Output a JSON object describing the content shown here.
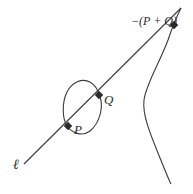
{
  "diagram": {
    "line_label": "ℓ",
    "points": [
      {
        "id": "P",
        "label": "P",
        "x": 68,
        "y": 126
      },
      {
        "id": "Q",
        "label": "Q",
        "x": 99,
        "y": 95
      },
      {
        "id": "neg_sum",
        "label": "−(P + Q)",
        "x": 174,
        "y": 25
      }
    ],
    "colors": {
      "stroke": "#3a3a3a",
      "point": "#2a2a2a",
      "background": "#ffffff"
    }
  }
}
